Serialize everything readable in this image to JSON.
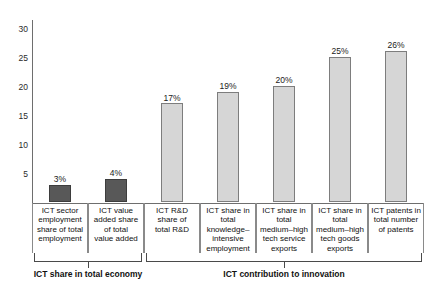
{
  "chart_data": {
    "type": "bar",
    "title": "",
    "subtitle": "",
    "xlabel": "",
    "ylabel": "",
    "ylim": [
      0,
      31.5
    ],
    "grid": false,
    "legend": "none",
    "y_ticks": [
      "5",
      "10",
      "15",
      "20",
      "25",
      "30"
    ],
    "y_tick_values": [
      5,
      10,
      15,
      20,
      25,
      30
    ],
    "categories": [
      "ICT sector employment share of total employment",
      "ICT value added share of total value added",
      "ICT R&D share of total R&D",
      "ICT share in total knowledge-intensive employment",
      "ICT share in total medium-high tech service exports",
      "ICT share in total medium-high tech goods exports",
      "ICT patents in total number of patents"
    ],
    "category_lines": [
      [
        "ICT sector",
        "employment",
        "share of total",
        "employment"
      ],
      [
        "ICT value",
        "added share",
        "of total",
        "value added"
      ],
      [
        "ICT R&D",
        "share of",
        "total R&D"
      ],
      [
        "ICT share in",
        "total",
        "knowledge–",
        "intensive",
        "employment"
      ],
      [
        "ICT share in",
        "total",
        "medium–high",
        "tech service",
        "exports"
      ],
      [
        "ICT share in",
        "total",
        "medium–high",
        "tech goods",
        "exports"
      ],
      [
        "ICT patents in",
        "total number",
        "of patents"
      ]
    ],
    "values": [
      3,
      4,
      17,
      19,
      20,
      25,
      26
    ],
    "data_labels": [
      "3%",
      "4%",
      "17%",
      "19%",
      "20%",
      "25%",
      "26%"
    ],
    "bar_colors": [
      "#585858",
      "#585858",
      "#d6d6d6",
      "#d6d6d6",
      "#d6d6d6",
      "#d6d6d6",
      "#d6d6d6"
    ],
    "groups": [
      {
        "label": "ICT share in total economy",
        "from": 0,
        "to": 1
      },
      {
        "label": "ICT contribution to innovation",
        "from": 2,
        "to": 6
      }
    ]
  },
  "colors": {
    "dark_bar": "#585858",
    "light_bar": "#d6d6d6",
    "axis": "#6e6e6e",
    "text": "#111111",
    "background": "#ffffff"
  }
}
